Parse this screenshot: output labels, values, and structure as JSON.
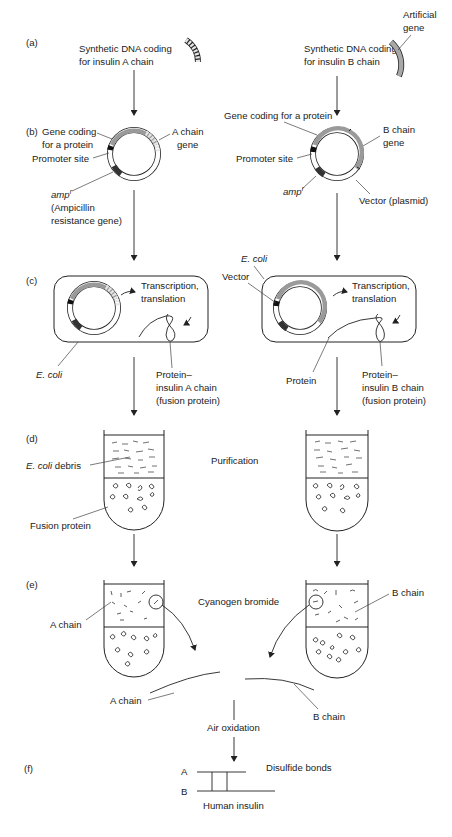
{
  "steps": {
    "a": {
      "label": "(a)",
      "left_text": [
        "Synthetic DNA coding",
        "for insulin A chain"
      ],
      "right_text": [
        "Synthetic DNA coding",
        "for insulin B chain"
      ],
      "artificial_gene": [
        "Artificial",
        "gene"
      ]
    },
    "b": {
      "label": "(b)",
      "left": {
        "gene_coding": [
          "Gene coding",
          "for a protein"
        ],
        "promoter": "Promoter site",
        "amp": "amp",
        "amp_sup": "r",
        "amp_desc": [
          "(Ampicillin",
          "resistance gene)"
        ],
        "chain_gene": [
          "A chain",
          "gene"
        ]
      },
      "right": {
        "gene_coding": "Gene coding for a protein",
        "promoter": "Promoter site",
        "amp": "amp",
        "amp_sup": "r",
        "chain_gene": [
          "B chain",
          "gene"
        ],
        "vector": "Vector (plasmid)"
      }
    },
    "c": {
      "label": "(c)",
      "left": {
        "process": [
          "Transcription,",
          "translation"
        ],
        "ecoli": "E. coli",
        "fusion": [
          "Protein–",
          "insulin A chain",
          "(fusion protein)"
        ]
      },
      "right": {
        "ecoli": "E. coli",
        "vector": "Vector",
        "process": [
          "Transcription,",
          "translation"
        ],
        "protein": "Protein",
        "fusion": [
          "Protein–",
          "insulin B chain",
          "(fusion protein)"
        ]
      }
    },
    "d": {
      "label": "(d)",
      "purification": "Purification",
      "debris_italic": "E. coli",
      "debris_rest": " debris",
      "fusion_protein": "Fusion protein"
    },
    "e": {
      "label": "(e)",
      "reagent": "Cyanogen bromide",
      "a_chain": "A chain",
      "b_chain": "B chain",
      "a_chain_out": "A chain",
      "b_chain_out": "B chain",
      "oxidation": "Air oxidation"
    },
    "f": {
      "label": "(f)",
      "chain_a": "A",
      "chain_b": "B",
      "disulfide": "Disulfide bonds",
      "product": "Human insulin"
    }
  },
  "colors": {
    "ink": "#222222",
    "gene_gray": "#9a9a9a",
    "light_gray": "#d8d8d8"
  }
}
